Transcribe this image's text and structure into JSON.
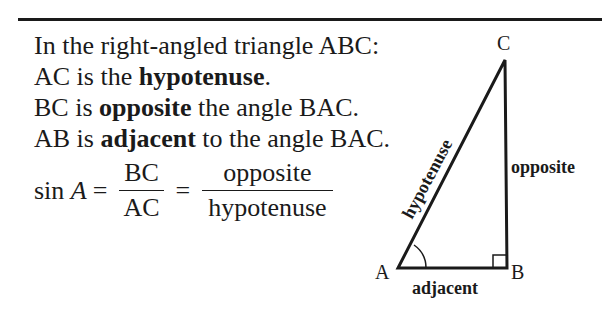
{
  "text": {
    "line1": "In the right-angled triangle ABC:",
    "line2_pre": "AC is the ",
    "line2_bold": "hypotenuse",
    "line2_post": ".",
    "line3_pre": "BC is ",
    "line3_bold": "opposite",
    "line3_post": " the angle BAC.",
    "line4_pre": "AB is ",
    "line4_bold": "adjacent",
    "line4_post": " to the angle BAC."
  },
  "formula": {
    "lhs_fn": "sin",
    "lhs_var": "A",
    "eq": "=",
    "frac1_num": "BC",
    "frac1_den": "AC",
    "frac2_num": "opposite",
    "frac2_den": "hypotenuse"
  },
  "diagram": {
    "vertex_a": "A",
    "vertex_b": "B",
    "vertex_c": "C",
    "side_hypotenuse": "hypotenuse",
    "side_opposite": "opposite",
    "side_adjacent": "adjacent"
  }
}
